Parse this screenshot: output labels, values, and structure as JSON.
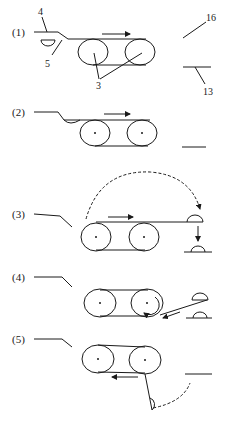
{
  "diagram": {
    "type": "process-steps",
    "steps": [
      {
        "label": "(1)",
        "description": "belt moves right; part under arm"
      },
      {
        "label": "(2)",
        "description": "part placed at belt entry"
      },
      {
        "label": "(3)",
        "description": "part transferred over belt to exit and dropped"
      },
      {
        "label": "(4)",
        "description": "belt reverses around roller; parts return"
      },
      {
        "label": "(5)",
        "description": "belt moves left; part swings down"
      }
    ],
    "callouts": {
      "c4": "4",
      "c5": "5",
      "c3": "3",
      "c16": "16",
      "c13": "13"
    },
    "colors": {
      "ink": "#1a1a1a",
      "background": "#ffffff"
    }
  }
}
